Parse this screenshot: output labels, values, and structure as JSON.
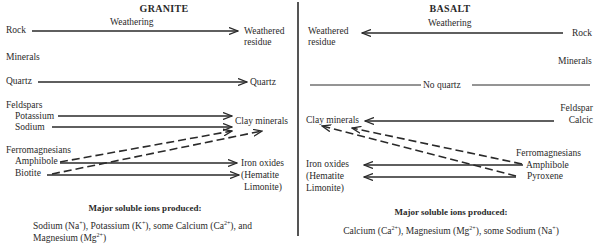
{
  "granite": {
    "title": "GRANITE",
    "weathering_label": "Weathering",
    "rock_label": "Rock",
    "weathered_residue": [
      "Weathered",
      "residue"
    ],
    "minerals_heading": "Minerals",
    "quartz_from": "Quartz",
    "quartz_to": "Quartz",
    "feldspars_heading": "Feldspars",
    "potassium": "Potassium",
    "sodium": "Sodium",
    "clay_minerals": "Clay minerals",
    "ferromagnesians_heading": "Ferromagnesians",
    "amphibole": "Amphibole",
    "biotite": "Biotite",
    "iron_oxides": [
      "Iron oxides",
      "(Hematite",
      "Limonite)"
    ],
    "ions_heading": "Major soluble ions produced:",
    "ions": {
      "line1_parts": [
        "Sodium (Na",
        "+",
        "), Potassium (K",
        "+",
        "),  some Calcium (Ca",
        "2+",
        "), and"
      ],
      "line2_parts": [
        "Magnesium (Mg",
        "2+",
        ")"
      ]
    }
  },
  "basalt": {
    "title": "BASALT",
    "weathering_label": "Weathering",
    "rock_label": "Rock",
    "weathered_residue": [
      "Weathered",
      "residue"
    ],
    "minerals_heading": "Minerals",
    "no_quartz": "No quartz",
    "feldspar_heading": "Feldspar",
    "calcic": "Calcic",
    "clay_minerals": "Clay minerals",
    "ferromagnesians_heading": "Ferromagnesians",
    "amphibole": "Amphibole",
    "pyroxene": "Pyroxene",
    "iron_oxides": [
      "Iron oxides",
      "(Hematite",
      "Limonite)"
    ],
    "ions_heading": "Major soluble ions produced:",
    "ions": {
      "line1_parts": [
        "Calcium (Ca",
        "2+",
        "), Magnesium (Mg",
        "2+",
        "), some Sodium (Na",
        "+",
        ")"
      ]
    }
  },
  "colors": {
    "ink": "#2a2a2a",
    "divider": "#555555",
    "background": "#ffffff"
  }
}
